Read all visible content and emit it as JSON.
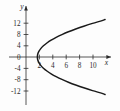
{
  "figure": {
    "background_color": "#fdfdfd",
    "ink_color": "#2b2b2b",
    "curve_color": "#1a1a1a",
    "width": 120,
    "height": 111
  },
  "axes": {
    "x_axis_label": "x",
    "y_axis_label": "y",
    "x_ticks": [
      "2",
      "4",
      "6",
      "8",
      "10"
    ],
    "x_tick_values": [
      2,
      4,
      6,
      8,
      10
    ],
    "y_ticks": [
      "12",
      "8",
      "4",
      "0",
      "-4",
      "-8",
      "-12"
    ],
    "y_tick_values": [
      12,
      8,
      4,
      0,
      -4,
      -8,
      -12
    ],
    "origin_label": "0",
    "x_range": [
      -0.8,
      11.8
    ],
    "y_range": [
      -14.8,
      14.8
    ],
    "arrows": [
      "x-positive",
      "y-positive"
    ],
    "grid": false
  },
  "chart_data": {
    "type": "line",
    "title": "",
    "xlabel": "x",
    "ylabel": "y",
    "xlim": [
      -0.8,
      11.8
    ],
    "ylim": [
      -14.8,
      14.8
    ],
    "grid": false,
    "legend_position": "none",
    "annotations": [],
    "curve_description": "Sideways parabola opening to the right with vertex at approximately (1.7, 0)",
    "equation": "x = 1.7 + y^2 / 18.6",
    "series": [
      {
        "name": "parabola-upper-branch",
        "x": [
          1.7,
          1.75,
          1.92,
          2.2,
          2.6,
          3.12,
          3.75,
          4.5,
          5.36,
          6.33,
          7.42,
          8.62,
          9.93,
          11.36,
          11.8
        ],
        "y": [
          0.0,
          1.0,
          2.0,
          3.0,
          4.0,
          5.0,
          6.0,
          7.0,
          8.0,
          9.0,
          10.0,
          11.0,
          12.0,
          13.0,
          13.4
        ]
      },
      {
        "name": "parabola-lower-branch",
        "x": [
          1.7,
          1.75,
          1.92,
          2.2,
          2.6,
          3.12,
          3.75,
          4.5,
          5.36,
          6.33,
          7.42,
          8.62,
          9.93,
          11.36,
          11.8
        ],
        "y": [
          0.0,
          -1.0,
          -2.0,
          -3.0,
          -4.0,
          -5.0,
          -6.0,
          -7.0,
          -8.0,
          -9.0,
          -10.0,
          -11.0,
          -12.0,
          -13.0,
          -13.4
        ]
      }
    ],
    "vertex": {
      "x": 1.7,
      "y": 0
    }
  }
}
